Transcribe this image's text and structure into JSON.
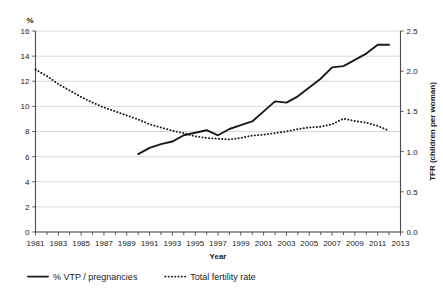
{
  "chart_data": {
    "type": "line",
    "title": "",
    "xlabel": "Year",
    "ylabel": "%",
    "y2label": "TFR (children per woman)",
    "xlim": [
      1981,
      2013
    ],
    "ylim": [
      0,
      16
    ],
    "y2lim": [
      0.0,
      2.5
    ],
    "grid": true,
    "legend_position": "bottom-left",
    "x_tick_labels": [
      "1981",
      "1983",
      "1985",
      "1987",
      "1989",
      "1991",
      "1993",
      "1995",
      "1997",
      "1999",
      "2001",
      "2003",
      "2005",
      "2007",
      "2009",
      "2011",
      "2013"
    ],
    "x_tick_values": [
      1981,
      1983,
      1985,
      1987,
      1989,
      1991,
      1993,
      1995,
      1997,
      1999,
      2001,
      2003,
      2005,
      2007,
      2009,
      2011,
      2013
    ],
    "x_minor_ticks": [
      1982,
      1984,
      1986,
      1988,
      1990,
      1992,
      1994,
      1996,
      1998,
      2000,
      2002,
      2004,
      2006,
      2008,
      2010,
      2012
    ],
    "y_tick_labels": [
      "0",
      "2",
      "4",
      "6",
      "8",
      "10",
      "12",
      "14",
      "16"
    ],
    "y_tick_values": [
      0,
      2,
      4,
      6,
      8,
      10,
      12,
      14,
      16
    ],
    "y2_tick_labels": [
      "0.0",
      "0.5",
      "1.0",
      "1.5",
      "2.0",
      "2.5"
    ],
    "y2_tick_values": [
      0.0,
      0.5,
      1.0,
      1.5,
      2.0,
      2.5
    ],
    "series": [
      {
        "name": "% VTP / pregnancies",
        "style": "solid",
        "axis": "left",
        "x": [
          1990,
          1991,
          1992,
          1993,
          1994,
          1995,
          1996,
          1997,
          1998,
          1999,
          2000,
          2001,
          2002,
          2003,
          2004,
          2005,
          2006,
          2007,
          2008,
          2009,
          2010,
          2011,
          2012
        ],
        "values": [
          6.2,
          6.7,
          7.0,
          7.2,
          7.7,
          7.9,
          8.1,
          7.7,
          8.2,
          8.5,
          8.8,
          9.6,
          10.4,
          10.3,
          10.8,
          11.5,
          12.2,
          13.1,
          13.2,
          13.7,
          14.2,
          14.9,
          14.9
        ]
      },
      {
        "name": "Total fertility rate",
        "style": "dotted",
        "axis": "right",
        "x": [
          1981,
          1982,
          1983,
          1984,
          1985,
          1986,
          1987,
          1988,
          1989,
          1990,
          1991,
          1992,
          1993,
          1994,
          1995,
          1996,
          1997,
          1998,
          1999,
          2000,
          2001,
          2002,
          2003,
          2004,
          2005,
          2006,
          2007,
          2008,
          2009,
          2010,
          2011,
          2012
        ],
        "values": [
          2.02,
          1.94,
          1.84,
          1.76,
          1.68,
          1.61,
          1.55,
          1.5,
          1.45,
          1.4,
          1.34,
          1.3,
          1.26,
          1.23,
          1.19,
          1.17,
          1.16,
          1.15,
          1.17,
          1.2,
          1.21,
          1.23,
          1.25,
          1.28,
          1.3,
          1.31,
          1.34,
          1.41,
          1.38,
          1.36,
          1.32,
          1.26
        ]
      }
    ],
    "legend": [
      {
        "label": "% VTP / pregnancies",
        "style": "solid"
      },
      {
        "label": "Total fertility rate",
        "style": "dotted"
      }
    ],
    "colors": {
      "line": "#1a1a1a",
      "grid": "#c9c9c9",
      "axis": "#4a4a4a",
      "background": "#ffffff"
    }
  }
}
